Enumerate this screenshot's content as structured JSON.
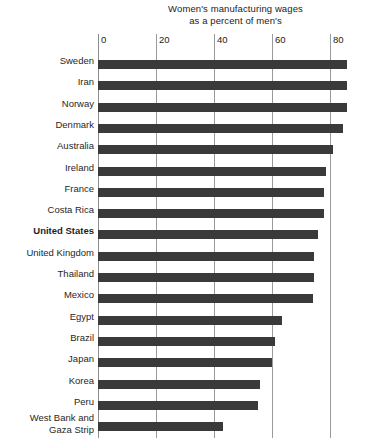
{
  "chart_data": {
    "type": "bar",
    "orientation": "horizontal",
    "title": "Women's manufacturing wages as a percent of men's",
    "title_lines": [
      "Women's manufacturing wages",
      "as a percent of men's"
    ],
    "xlabel": "",
    "ylabel": "",
    "xlim": [
      0,
      87
    ],
    "xticks": [
      0,
      20,
      40,
      60,
      80
    ],
    "xtick_labels": [
      "0",
      "20",
      "40",
      "60",
      "80"
    ],
    "grid": true,
    "grid_axis": "x",
    "axis_position": "top",
    "legend": null,
    "bar_color": "#3a3a3a",
    "categories": [
      "Sweden",
      "Iran",
      "Norway",
      "Denmark",
      "Australia",
      "Ireland",
      "France",
      "Costa Rica",
      "United States",
      "United Kingdom",
      "Thailand",
      "Mexico",
      "Egypt",
      "Brazil",
      "Japan",
      "Korea",
      "Peru",
      "West Bank and\nGaza Strip"
    ],
    "values": [
      86,
      86,
      86,
      84.5,
      81,
      78.5,
      78,
      78,
      76,
      74.5,
      74.5,
      74,
      63.5,
      61,
      60,
      56,
      55,
      43
    ],
    "highlighted": [
      "United States"
    ]
  }
}
